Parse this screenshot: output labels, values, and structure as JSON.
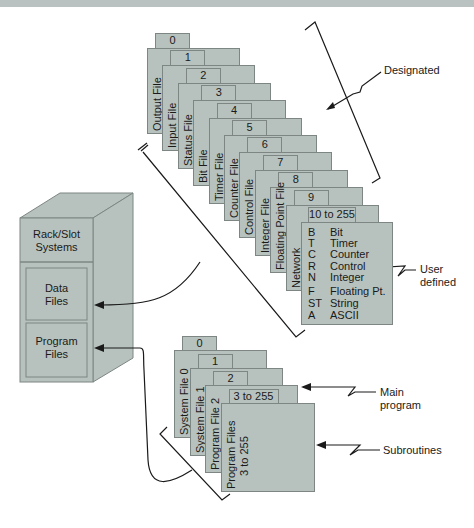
{
  "colors": {
    "card_fill": "#b7c2be",
    "card_border": "#7d8683",
    "line": "#1a1a1a",
    "topbar": "#b9c2c0"
  },
  "cabinet": {
    "title_line1": "Rack/Slot",
    "title_line2": "Systems",
    "data_files_line1": "Data",
    "data_files_line2": "Files",
    "program_files_line1": "Program",
    "program_files_line2": "Files"
  },
  "data_files": [
    {
      "tab": "0",
      "label": "Output File"
    },
    {
      "tab": "1",
      "label": "Input File"
    },
    {
      "tab": "2",
      "label": "Status File"
    },
    {
      "tab": "3",
      "label": "Bit File"
    },
    {
      "tab": "4",
      "label": "Timer File"
    },
    {
      "tab": "5",
      "label": "Counter File"
    },
    {
      "tab": "6",
      "label": "Control File"
    },
    {
      "tab": "7",
      "label": "Integer File"
    },
    {
      "tab": "8",
      "label": "Floating Point File"
    },
    {
      "tab": "9",
      "label": "Network"
    }
  ],
  "user_defined_card": {
    "tab": "10 to 255",
    "types": [
      {
        "code": "B",
        "name": "Bit"
      },
      {
        "code": "T",
        "name": "Timer"
      },
      {
        "code": "C",
        "name": "Counter"
      },
      {
        "code": "R",
        "name": "Control"
      },
      {
        "code": "N",
        "name": "Integer"
      },
      {
        "code": "F",
        "name": "Floating Pt."
      },
      {
        "code": "ST",
        "name": "String"
      },
      {
        "code": "A",
        "name": "ASCII"
      }
    ]
  },
  "program_files": [
    {
      "tab": "0",
      "label": "System File 0"
    },
    {
      "tab": "1",
      "label": "System File 1"
    },
    {
      "tab": "2",
      "label": "Program File 2"
    }
  ],
  "program_last_card": {
    "tab": "3 to 255",
    "line1": "Program Files",
    "line2": "3 to 255"
  },
  "annotations": {
    "designated": "Designated",
    "user_defined_line1": "User",
    "user_defined_line2": "defined",
    "main_program_line1": "Main",
    "main_program_line2": "program",
    "subroutines": "Subroutines"
  }
}
